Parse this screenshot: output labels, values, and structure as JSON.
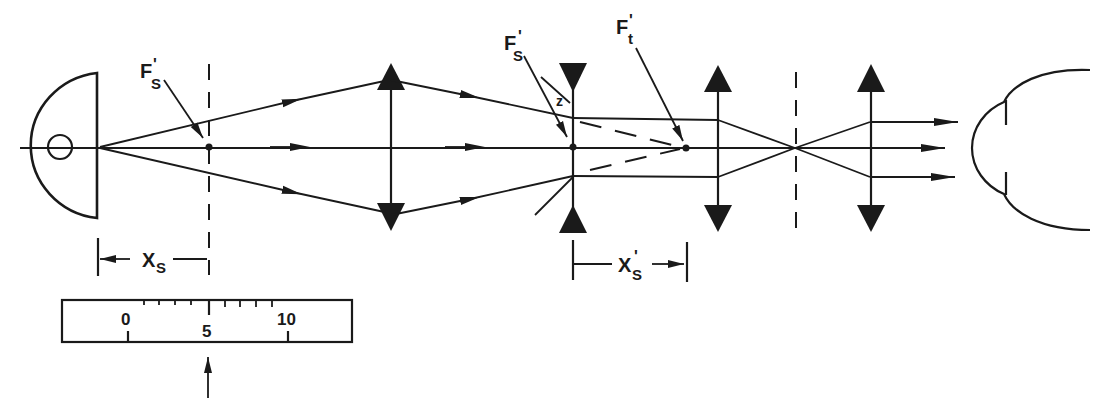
{
  "figure": {
    "colors": {
      "ink": "#1a1a1a",
      "background": "#ffffff"
    }
  },
  "labels": {
    "fs_prime_left": {
      "main": "F",
      "sub": "S",
      "prime": "'"
    },
    "fs_prime_right": {
      "main": "F",
      "sub": "S",
      "prime": "'"
    },
    "ft_prime": {
      "main": "F",
      "sub": "t",
      "prime": "'"
    },
    "z_label": "z",
    "xs": {
      "main": "X",
      "sub": "S"
    },
    "xs_prime": {
      "main": "X",
      "sub": "S",
      "prime": "'"
    }
  },
  "scale": {
    "tick_labels": [
      "0",
      "5",
      "10"
    ],
    "pointer": "arrow-up"
  },
  "components": [
    {
      "name": "observer-eye-left",
      "type": "eye"
    },
    {
      "name": "target-plane",
      "type": "dashed-plane"
    },
    {
      "name": "collimating-lens",
      "type": "convex-lens"
    },
    {
      "name": "test-lens",
      "type": "concave-lens"
    },
    {
      "name": "relay-lens-1",
      "type": "convex-lens"
    },
    {
      "name": "field-stop",
      "type": "dashed-plane"
    },
    {
      "name": "eyepiece-lens",
      "type": "convex-lens"
    },
    {
      "name": "observer-eye-right",
      "type": "eye"
    }
  ]
}
